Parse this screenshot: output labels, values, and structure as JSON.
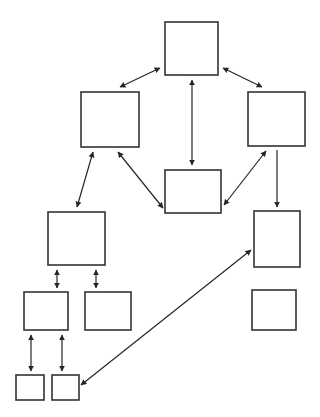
{
  "diagram": {
    "type": "node-link-graph",
    "canvas": {
      "width": 320,
      "height": 417,
      "background": "#ffffff"
    },
    "style": {
      "node_fill": "#ffffff",
      "node_stroke": "#333333",
      "node_stroke_width": 1.6,
      "edge_stroke": "#262626",
      "edge_stroke_width": 1.2
    },
    "header_fragment": "",
    "nodes": [
      {
        "id": "n1",
        "label": "",
        "x": 165,
        "y": 22,
        "w": 53,
        "h": 53
      },
      {
        "id": "n2",
        "label": "",
        "x": 81,
        "y": 92,
        "w": 58,
        "h": 55
      },
      {
        "id": "n3",
        "label": "",
        "x": 248,
        "y": 92,
        "w": 57,
        "h": 54
      },
      {
        "id": "n4",
        "label": "",
        "x": 165,
        "y": 170,
        "w": 56,
        "h": 43
      },
      {
        "id": "n5",
        "label": "",
        "x": 48,
        "y": 212,
        "w": 57,
        "h": 53
      },
      {
        "id": "n6",
        "label": "",
        "x": 24,
        "y": 292,
        "w": 44,
        "h": 38
      },
      {
        "id": "n7",
        "label": "",
        "x": 85,
        "y": 292,
        "w": 46,
        "h": 38
      },
      {
        "id": "n8",
        "label": "",
        "x": 16,
        "y": 375,
        "w": 28,
        "h": 25
      },
      {
        "id": "n9",
        "label": "",
        "x": 52,
        "y": 375,
        "w": 27,
        "h": 25
      },
      {
        "id": "n10",
        "label": "",
        "x": 254,
        "y": 211,
        "w": 46,
        "h": 56
      },
      {
        "id": "n11",
        "label": "",
        "x": 252,
        "y": 290,
        "w": 44,
        "h": 40
      }
    ],
    "edges": [
      {
        "id": "e1",
        "from": "n1",
        "to": "n2",
        "arrow": "double",
        "x1": 160,
        "y1": 68,
        "x2": 120,
        "y2": 87
      },
      {
        "id": "e2",
        "from": "n1",
        "to": "n3",
        "arrow": "double",
        "x1": 223,
        "y1": 68,
        "x2": 262,
        "y2": 87
      },
      {
        "id": "e3",
        "from": "n1",
        "to": "n4",
        "arrow": "double",
        "x1": 192,
        "y1": 80,
        "x2": 192,
        "y2": 165
      },
      {
        "id": "e4",
        "from": "n2",
        "to": "n4",
        "arrow": "double",
        "x1": 118,
        "y1": 152,
        "x2": 163,
        "y2": 208
      },
      {
        "id": "e5",
        "from": "n4",
        "to": "n3",
        "arrow": "double",
        "x1": 224,
        "y1": 205,
        "x2": 266,
        "y2": 151
      },
      {
        "id": "e6",
        "from": "n3",
        "to": "n10",
        "arrow": "single",
        "x1": 277,
        "y1": 150,
        "x2": 277,
        "y2": 207
      },
      {
        "id": "e7",
        "from": "n2",
        "to": "n5",
        "arrow": "double",
        "x1": 93,
        "y1": 152,
        "x2": 77,
        "y2": 207
      },
      {
        "id": "e8",
        "from": "n5",
        "to": "n6",
        "arrow": "double",
        "x1": 57,
        "y1": 270,
        "x2": 57,
        "y2": 288
      },
      {
        "id": "e9",
        "from": "n5",
        "to": "n7",
        "arrow": "double",
        "x1": 96,
        "y1": 270,
        "x2": 96,
        "y2": 288
      },
      {
        "id": "e10",
        "from": "n6",
        "to": "n8",
        "arrow": "double",
        "x1": 31,
        "y1": 335,
        "x2": 31,
        "y2": 371
      },
      {
        "id": "e11",
        "from": "n6",
        "to": "n9",
        "arrow": "double",
        "x1": 62,
        "y1": 335,
        "x2": 62,
        "y2": 371
      },
      {
        "id": "e12",
        "from": "n9",
        "to": "n10",
        "arrow": "double",
        "x1": 81,
        "y1": 385,
        "x2": 251,
        "y2": 250
      }
    ]
  }
}
